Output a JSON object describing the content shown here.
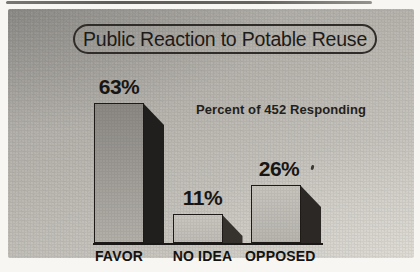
{
  "title": "Public Reaction to Potable Reuse",
  "annotation": "Percent of 452 Responding",
  "chart_data": {
    "type": "bar",
    "style": "3d-block-bars",
    "title": "Public Reaction to Potable Reuse",
    "annotation": "Percent of 452 Responding",
    "categories": [
      "FAVOR",
      "NO IDEA",
      "OPPOSED"
    ],
    "values": [
      63,
      11,
      26
    ],
    "value_labels": [
      "63%",
      "11%",
      "26%"
    ],
    "unit": "percent",
    "respondents": 452,
    "grid": false,
    "legend": "none",
    "xlabel": "",
    "ylabel": "",
    "ylim": [
      0,
      70
    ],
    "layout": {
      "baseline_from_bottom_px": 15,
      "bar_lefts_px": [
        86,
        164.5,
        243
      ],
      "bar_heights_px": [
        140,
        29,
        58
      ],
      "bar_width_px": 50,
      "depth_x_px": 20,
      "depth_y_px": 22,
      "label_dx_px": [
        0,
        5,
        3
      ]
    }
  },
  "colors": {
    "frame": "#f7f6f3",
    "photo_bg_dark": "#a5a39f",
    "photo_bg_light": "#d5d2cb",
    "ink": "#1b1917",
    "baseline": "#1b1917",
    "streak": "#55524e",
    "bar_front_top": [
      "#8b8884",
      "#c9c6c0",
      "#c7c4be"
    ],
    "bar_front_bottom": [
      "#b3b0aa",
      "#bfbcb6",
      "#b8b5af"
    ],
    "bar_side": [
      "#211f1d",
      "#36332f",
      "#2b2825"
    ]
  }
}
